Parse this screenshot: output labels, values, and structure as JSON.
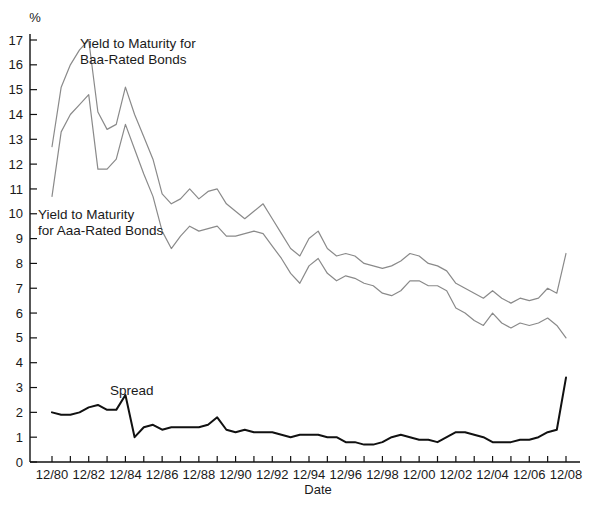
{
  "chart_data": {
    "type": "line",
    "title": "",
    "xlabel": "Date",
    "ylabel": "%",
    "unit_label": "%",
    "grid": false,
    "legend_position": "inline-annotations",
    "ylim": [
      0,
      17
    ],
    "yticks": [
      0,
      1,
      2,
      3,
      4,
      5,
      6,
      7,
      8,
      9,
      10,
      11,
      12,
      13,
      14,
      15,
      16,
      17
    ],
    "ytick_labels": [
      "0",
      "1",
      "2",
      "3",
      "4",
      "5",
      "6",
      "7",
      "8",
      "9",
      "10",
      "11",
      "12",
      "13",
      "14",
      "15",
      "16",
      "17"
    ],
    "xlim": [
      1980,
      2008.5
    ],
    "xtick_labels": [
      "12/80",
      "12/82",
      "12/84",
      "12/86",
      "12/88",
      "12/90",
      "12/92",
      "12/94",
      "12/96",
      "12/98",
      "12/00",
      "12/02",
      "12/04",
      "12/06",
      "12/08"
    ],
    "xtick_values": [
      1980,
      1982,
      1984,
      1986,
      1988,
      1990,
      1992,
      1994,
      1996,
      1998,
      2000,
      2002,
      2004,
      2006,
      2008
    ],
    "minor_xticks_interval_years": 1,
    "x": [
      1980,
      1980.5,
      1981,
      1981.5,
      1982,
      1982.5,
      1983,
      1983.5,
      1984,
      1984.5,
      1985,
      1985.5,
      1986,
      1986.5,
      1987,
      1987.5,
      1988,
      1988.5,
      1989,
      1989.5,
      1990,
      1990.5,
      1991,
      1991.5,
      1992,
      1992.5,
      1993,
      1993.5,
      1994,
      1994.5,
      1995,
      1995.5,
      1996,
      1996.5,
      1997,
      1997.5,
      1998,
      1998.5,
      1999,
      1999.5,
      2000,
      2000.5,
      2001,
      2001.5,
      2002,
      2002.5,
      2003,
      2003.5,
      2004,
      2004.5,
      2005,
      2005.5,
      2006,
      2006.5,
      2007,
      2007.5,
      2008
    ],
    "series": [
      {
        "name": "Yield to Maturity for Baa-Rated Bonds",
        "color": "#8a8a8a",
        "values": [
          12.7,
          15.1,
          16.0,
          16.6,
          17.0,
          14.1,
          13.4,
          13.6,
          15.1,
          14.0,
          13.1,
          12.2,
          10.8,
          10.4,
          10.6,
          11.0,
          10.6,
          10.9,
          11.0,
          10.4,
          10.1,
          9.8,
          10.1,
          10.4,
          9.8,
          9.2,
          8.6,
          8.3,
          9.0,
          9.3,
          8.6,
          8.3,
          8.4,
          8.3,
          8.0,
          7.9,
          7.8,
          7.9,
          8.1,
          8.4,
          8.3,
          8.0,
          7.9,
          7.7,
          7.2,
          7.0,
          6.8,
          6.6,
          6.9,
          6.6,
          6.4,
          6.6,
          6.5,
          6.6,
          7.0,
          6.8,
          8.4
        ],
        "unit": "%"
      },
      {
        "name": "Yield to Maturity for Aaa-Rated Bonds",
        "color": "#8a8a8a",
        "values": [
          10.7,
          13.3,
          14.0,
          14.4,
          14.8,
          11.8,
          11.8,
          12.2,
          13.6,
          12.6,
          11.6,
          10.7,
          9.3,
          8.6,
          9.1,
          9.5,
          9.3,
          9.4,
          9.5,
          9.1,
          9.1,
          9.2,
          9.3,
          9.2,
          8.7,
          8.2,
          7.6,
          7.2,
          7.9,
          8.2,
          7.6,
          7.3,
          7.5,
          7.4,
          7.2,
          7.1,
          6.8,
          6.7,
          6.9,
          7.3,
          7.3,
          7.1,
          7.1,
          6.9,
          6.2,
          6.0,
          5.7,
          5.5,
          6.0,
          5.6,
          5.4,
          5.6,
          5.5,
          5.6,
          5.8,
          5.5,
          5.0
        ],
        "unit": "%"
      },
      {
        "name": "Spread",
        "color": "#111111",
        "values": [
          2.0,
          1.9,
          1.9,
          2.0,
          2.2,
          2.3,
          2.1,
          2.1,
          2.7,
          1.0,
          1.4,
          1.5,
          1.3,
          1.4,
          1.4,
          1.4,
          1.4,
          1.5,
          1.8,
          1.3,
          1.2,
          1.3,
          1.2,
          1.2,
          1.2,
          1.1,
          1.0,
          1.1,
          1.1,
          1.1,
          1.0,
          1.0,
          0.8,
          0.8,
          0.7,
          0.7,
          0.8,
          1.0,
          1.1,
          1.0,
          0.9,
          0.9,
          0.8,
          1.0,
          1.2,
          1.2,
          1.1,
          1.0,
          0.8,
          0.8,
          0.8,
          0.9,
          0.9,
          1.0,
          1.2,
          1.3,
          3.4
        ],
        "unit": "%"
      }
    ],
    "annotations": [
      {
        "id": "baa-annotation",
        "lines": [
          "Yield to Maturity for",
          "Baa-Rated Bonds"
        ],
        "x_px": 80,
        "y_px": 48
      },
      {
        "id": "aaa-annotation",
        "lines": [
          "Yield to Maturity",
          "for Aaa-Rated Bonds"
        ],
        "x_px": 38,
        "y_px": 219
      },
      {
        "id": "spread-annotation",
        "lines": [
          "Spread"
        ],
        "x_px": 110,
        "y_px": 395
      }
    ]
  }
}
